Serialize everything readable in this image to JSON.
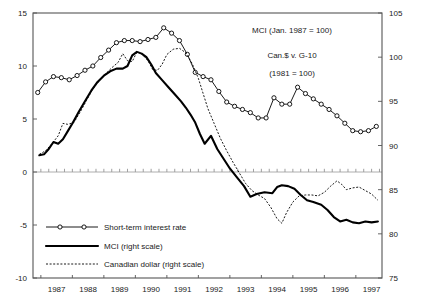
{
  "chart_data": {
    "type": "line",
    "title": "",
    "subtitle": "",
    "xlabel": "",
    "ylabel": "",
    "grid": false,
    "legend_position": "inside-bottom-left",
    "annotations": [
      "MCI (Jan. 1987 = 100)",
      "Can.$ v. G-10",
      "(1981 = 100)"
    ],
    "x_axis": {
      "label": "",
      "tick_labels": [
        "1987",
        "1988",
        "1989",
        "1990",
        "1991",
        "1992",
        "1993",
        "1994",
        "1995",
        "1996",
        "1997"
      ],
      "range": [
        1986.75,
        1997.83
      ],
      "minor_ticks_per_year": 4
    },
    "y_axis_left": {
      "label": "",
      "tick_labels": [
        "15",
        "10",
        "5",
        "0",
        "-5",
        "-10"
      ],
      "tick_values": [
        15,
        10,
        5,
        0,
        -5,
        -10
      ],
      "range": [
        -10,
        15
      ]
    },
    "y_axis_right": {
      "label": "",
      "tick_labels": [
        "105",
        "100",
        "95",
        "90",
        "85",
        "80",
        "75"
      ],
      "tick_values": [
        105,
        100,
        95,
        90,
        85,
        80,
        75
      ],
      "range": [
        75,
        105
      ]
    },
    "series": [
      {
        "name": "Short-term interest rate",
        "legend_label": "Short-term interest rate",
        "axis": "left",
        "style": "line-with-open-circles",
        "x": [
          1986.9,
          1987.15,
          1987.4,
          1987.65,
          1987.9,
          1988.15,
          1988.4,
          1988.65,
          1988.9,
          1989.15,
          1989.4,
          1989.65,
          1989.9,
          1990.15,
          1990.4,
          1990.65,
          1990.9,
          1991.15,
          1991.4,
          1991.65,
          1991.9,
          1992.15,
          1992.4,
          1992.65,
          1992.9,
          1993.15,
          1993.4,
          1993.65,
          1993.9,
          1994.15,
          1994.4,
          1994.65,
          1994.9,
          1995.15,
          1995.4,
          1995.65,
          1995.9,
          1996.15,
          1996.4,
          1996.65,
          1996.9,
          1997.15,
          1997.4,
          1997.65
        ],
        "values": [
          7.5,
          8.5,
          9.0,
          8.9,
          8.7,
          9.1,
          9.6,
          10.0,
          10.8,
          11.5,
          12.2,
          12.4,
          12.4,
          12.3,
          12.5,
          12.7,
          13.6,
          13.1,
          12.4,
          11.1,
          9.4,
          9.0,
          8.7,
          7.6,
          6.6,
          6.2,
          5.9,
          5.6,
          5.1,
          5.1,
          7.0,
          6.4,
          6.4,
          8.0,
          7.4,
          6.9,
          6.4,
          5.9,
          5.3,
          4.6,
          3.9,
          3.8,
          3.9,
          4.3
        ]
      },
      {
        "name": "MCI",
        "legend_label": "MCI (right scale)",
        "axis": "right",
        "style": "thick-solid",
        "x": [
          1986.95,
          1987.1,
          1987.25,
          1987.4,
          1987.55,
          1987.7,
          1987.85,
          1988.0,
          1988.2,
          1988.4,
          1988.6,
          1988.8,
          1989.0,
          1989.2,
          1989.4,
          1989.6,
          1989.75,
          1989.9,
          1990.05,
          1990.2,
          1990.35,
          1990.5,
          1990.65,
          1990.85,
          1991.05,
          1991.25,
          1991.45,
          1991.6,
          1991.75,
          1991.9,
          1992.05,
          1992.2,
          1992.4,
          1992.6,
          1992.8,
          1993.0,
          1993.2,
          1993.45,
          1993.65,
          1993.85,
          1994.1,
          1994.35,
          1994.5,
          1994.65,
          1994.85,
          1995.05,
          1995.25,
          1995.45,
          1995.65,
          1995.9,
          1996.1,
          1996.3,
          1996.5,
          1996.7,
          1996.9,
          1997.1,
          1997.3,
          1997.5,
          1997.7
        ],
        "values": [
          88.9,
          89.0,
          89.6,
          90.4,
          90.2,
          90.7,
          91.6,
          92.5,
          93.8,
          95.0,
          96.2,
          97.2,
          97.9,
          98.4,
          98.7,
          98.7,
          99.0,
          100.2,
          100.6,
          100.4,
          100.0,
          99.2,
          98.2,
          97.4,
          96.6,
          95.8,
          95.0,
          94.3,
          93.5,
          92.6,
          91.3,
          90.2,
          91.1,
          89.6,
          88.5,
          87.4,
          86.5,
          85.4,
          84.2,
          84.5,
          84.7,
          84.6,
          85.3,
          85.5,
          85.4,
          85.1,
          84.4,
          83.8,
          83.6,
          83.3,
          82.7,
          81.9,
          81.4,
          81.6,
          81.3,
          81.2,
          81.4,
          81.3,
          81.4
        ]
      },
      {
        "name": "Canadian dollar",
        "legend_label": "Canadian dollar (right scale)",
        "axis": "right",
        "style": "dotted",
        "x": [
          1986.95,
          1987.15,
          1987.35,
          1987.55,
          1987.7,
          1987.85,
          1988.05,
          1988.25,
          1988.45,
          1988.65,
          1988.85,
          1989.05,
          1989.25,
          1989.45,
          1989.6,
          1989.75,
          1989.9,
          1990.05,
          1990.2,
          1990.4,
          1990.55,
          1990.7,
          1990.85,
          1991.0,
          1991.2,
          1991.4,
          1991.6,
          1991.8,
          1992.0,
          1992.15,
          1992.3,
          1992.5,
          1992.7,
          1992.9,
          1993.1,
          1993.3,
          1993.5,
          1993.7,
          1993.9,
          1994.1,
          1994.3,
          1994.5,
          1994.65,
          1994.8,
          1995.0,
          1995.2,
          1995.4,
          1995.6,
          1995.8,
          1996.0,
          1996.2,
          1996.4,
          1996.55,
          1996.7,
          1996.9,
          1997.1,
          1997.3,
          1997.5,
          1997.7
        ],
        "values": [
          89.0,
          89.4,
          90.2,
          91.1,
          92.5,
          92.4,
          92.6,
          93.8,
          95.1,
          96.4,
          97.3,
          98.1,
          98.8,
          99.4,
          100.4,
          99.6,
          99.5,
          100.6,
          100.4,
          99.6,
          98.6,
          98.5,
          99.2,
          100.3,
          100.9,
          101.0,
          100.5,
          99.3,
          97.6,
          95.9,
          94.2,
          92.5,
          90.8,
          89.4,
          88.1,
          86.9,
          85.7,
          84.9,
          84.4,
          84.0,
          83.0,
          81.7,
          81.2,
          82.4,
          83.6,
          84.3,
          84.4,
          84.4,
          84.3,
          84.7,
          85.4,
          86.0,
          85.6,
          85.0,
          85.2,
          85.3,
          84.9,
          84.5,
          83.8
        ]
      }
    ]
  },
  "legend": {
    "items": [
      {
        "label": "Short-term interest rate",
        "marker": "open-circle-line"
      },
      {
        "label": "MCI (right scale)",
        "marker": "thick-solid-line"
      },
      {
        "label": "Canadian dollar (right scale)",
        "marker": "dotted-line"
      }
    ]
  }
}
